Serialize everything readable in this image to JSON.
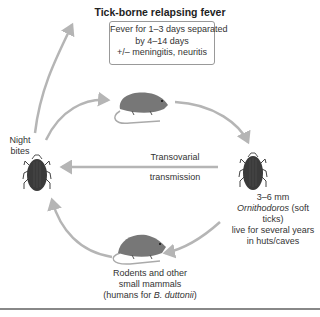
{
  "title": "Tick-borne relapsing fever",
  "symptoms_box": {
    "lines": [
      "Fever for 1–3 days separated",
      "by 4–14 days",
      "+/– meningitis, neuritis"
    ]
  },
  "labels": {
    "night_bites": [
      "Night",
      "bites"
    ],
    "transovarial": [
      "Transovarial",
      "transmission"
    ],
    "tick_description": {
      "size": "3–6 mm",
      "genus": "Ornithodoros",
      "genus_suffix": " (soft ticks)",
      "line3": "live for several years",
      "line4": "in huts/caves"
    },
    "rodent_description": {
      "line1": "Rodents and other",
      "line2": "small mammals",
      "line3_prefix": "(humans for ",
      "line3_species": "B. duttonii",
      "line3_suffix": ")"
    }
  },
  "icons": {
    "left_tick": "tick-icon",
    "right_tick": "tick-icon",
    "top_rodent": "rodent-icon",
    "bottom_rodent": "rodent-icon"
  },
  "colors": {
    "arrow": "#b5b5b5",
    "tick_body": "#3a3a3a",
    "rodent_body": "#777777",
    "box_border": "#999999",
    "rule": "#888888"
  }
}
